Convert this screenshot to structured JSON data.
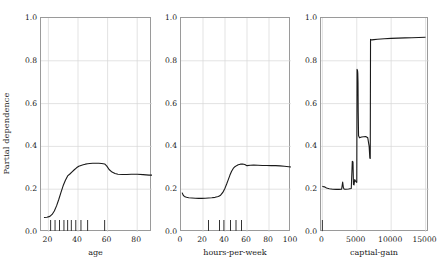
{
  "figure": {
    "ylabel": "Partial dependence",
    "background": "#ffffff",
    "line_color": "#1a1a1a",
    "grid_color": "#d7d7d7",
    "axis_color": "#9a9a9a"
  },
  "chart_data": [
    {
      "type": "line",
      "title": "",
      "xlabel": "age",
      "ylabel": "Partial dependence",
      "xlim": [
        15,
        90
      ],
      "ylim": [
        0.0,
        1.0
      ],
      "xticks": [
        20,
        40,
        60,
        80
      ],
      "yticks": [
        0.0,
        0.2,
        0.4,
        0.6,
        0.8,
        1.0
      ],
      "grid": true,
      "legend": "none",
      "x": [
        17,
        19,
        21,
        22.5,
        24,
        25.5,
        27,
        28.5,
        30,
        31.5,
        33,
        34.5,
        36,
        37.5,
        39,
        40.5,
        42,
        43.5,
        45,
        46.5,
        48,
        50,
        52,
        54,
        56,
        58,
        59.5,
        61,
        63,
        65,
        67,
        70,
        73,
        76,
        80,
        84,
        88,
        90
      ],
      "y": [
        0.068,
        0.069,
        0.073,
        0.082,
        0.098,
        0.122,
        0.152,
        0.185,
        0.217,
        0.242,
        0.262,
        0.271,
        0.281,
        0.291,
        0.3,
        0.307,
        0.311,
        0.314,
        0.317,
        0.319,
        0.32,
        0.321,
        0.321,
        0.321,
        0.32,
        0.318,
        0.308,
        0.292,
        0.28,
        0.273,
        0.27,
        0.269,
        0.269,
        0.27,
        0.27,
        0.268,
        0.266,
        0.266
      ],
      "rug": [
        21.5,
        24.5,
        27.5,
        30.5,
        33.0,
        35.5,
        38.5,
        42.0,
        46.5,
        58.0
      ]
    },
    {
      "type": "line",
      "title": "",
      "xlabel": "hours-per-week",
      "ylabel": "",
      "xlim": [
        0,
        100
      ],
      "ylim": [
        0.0,
        1.0
      ],
      "xticks": [
        0,
        20,
        40,
        60,
        80,
        100
      ],
      "yticks": [
        0.0,
        0.2,
        0.4,
        0.6,
        0.8,
        1.0
      ],
      "grid": true,
      "legend": "none",
      "x": [
        1,
        2,
        3,
        5,
        7,
        10,
        13,
        16,
        19,
        22,
        25,
        28,
        31,
        34,
        36,
        38,
        40,
        41.5,
        43,
        44.5,
        46,
        47.5,
        49,
        50.5,
        52,
        54,
        56,
        58,
        60,
        63,
        66,
        70,
        74,
        78,
        82,
        86,
        90,
        94,
        98,
        100
      ],
      "y": [
        0.184,
        0.172,
        0.166,
        0.162,
        0.16,
        0.159,
        0.158,
        0.157,
        0.157,
        0.158,
        0.159,
        0.16,
        0.162,
        0.166,
        0.172,
        0.185,
        0.205,
        0.224,
        0.245,
        0.266,
        0.284,
        0.297,
        0.305,
        0.31,
        0.314,
        0.317,
        0.318,
        0.315,
        0.31,
        0.312,
        0.313,
        0.312,
        0.311,
        0.311,
        0.31,
        0.31,
        0.309,
        0.307,
        0.305,
        0.304
      ],
      "rug": [
        25,
        35,
        39,
        45,
        50,
        55
      ]
    },
    {
      "type": "line",
      "title": "",
      "xlabel": "captial-gain",
      "ylabel": "",
      "xlim": [
        -200,
        15500
      ],
      "ylim": [
        0.0,
        1.0
      ],
      "xticks": [
        0,
        5000,
        10000,
        15000
      ],
      "yticks": [
        0.0,
        0.2,
        0.4,
        0.6,
        0.8,
        1.0
      ],
      "grid": true,
      "legend": "none",
      "x": [
        0,
        60,
        160,
        300,
        600,
        1000,
        1500,
        2000,
        2400,
        2800,
        2950,
        3050,
        3150,
        3250,
        3400,
        3800,
        4200,
        4350,
        4450,
        4520,
        4600,
        4700,
        4780,
        4860,
        4940,
        5000,
        5040,
        5080,
        5120,
        5150,
        5180,
        5210,
        5260,
        5400,
        5700,
        6000,
        6300,
        6600,
        6800,
        6900,
        6960,
        7000,
        7050,
        7100,
        7200,
        7500,
        8000,
        9000,
        10000,
        11000,
        12000,
        13000,
        14000,
        15000
      ],
      "y": [
        0.214,
        0.213,
        0.212,
        0.211,
        0.206,
        0.202,
        0.2,
        0.199,
        0.199,
        0.2,
        0.233,
        0.208,
        0.201,
        0.2,
        0.2,
        0.201,
        0.203,
        0.33,
        0.327,
        0.222,
        0.22,
        0.245,
        0.24,
        0.236,
        0.233,
        0.232,
        0.76,
        0.757,
        0.752,
        0.74,
        0.7,
        0.56,
        0.45,
        0.44,
        0.444,
        0.445,
        0.446,
        0.44,
        0.4,
        0.345,
        0.344,
        0.9,
        0.899,
        0.898,
        0.898,
        0.899,
        0.901,
        0.903,
        0.905,
        0.906,
        0.907,
        0.908,
        0.909,
        0.91
      ],
      "rug": [
        0
      ]
    }
  ]
}
